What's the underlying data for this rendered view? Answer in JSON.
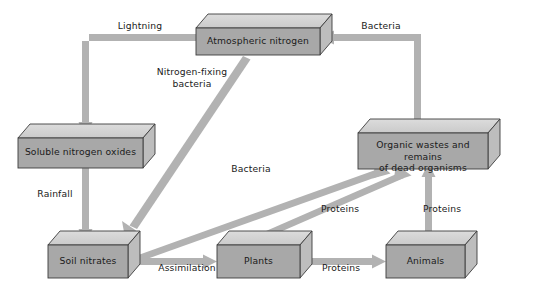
{
  "diagram": {
    "type": "flow-diagram",
    "background_color": "#ffffff",
    "palette": {
      "box_front": "#a8a8a8",
      "box_top": "#d2d2d2",
      "box_side": "#c2c2c2",
      "box_outline": "#3c3c3c",
      "arrow": "#b2b2b2",
      "text": "#1a1a1a"
    },
    "nodes": [
      {
        "id": "atmospheric-nitrogen",
        "label": "Atmospheric nitrogen"
      },
      {
        "id": "soluble-nitrogen-oxides",
        "label": "Soluble nitrogen oxides"
      },
      {
        "id": "organic-wastes",
        "label": "Organic wastes and remains\nof dead organisms"
      },
      {
        "id": "soil-nitrates",
        "label": "Soil nitrates"
      },
      {
        "id": "plants",
        "label": "Plants"
      },
      {
        "id": "animals",
        "label": "Animals"
      }
    ],
    "edges": [
      {
        "id": "lightning",
        "label": "Lightning",
        "from": "atmospheric-nitrogen",
        "to": "soluble-nitrogen-oxides"
      },
      {
        "id": "rainfall",
        "label": "Rainfall",
        "from": "soluble-nitrogen-oxides",
        "to": "soil-nitrates"
      },
      {
        "id": "nitrogen-fixing-bacteria",
        "label": "Nitrogen-fixing\nbacteria",
        "from": "atmospheric-nitrogen",
        "to": "soil-nitrates"
      },
      {
        "id": "bacteria-decay",
        "label": "Bacteria",
        "from": "soil-nitrates",
        "to": "organic-wastes"
      },
      {
        "id": "assimilation",
        "label": "Assimilation",
        "from": "soil-nitrates",
        "to": "plants"
      },
      {
        "id": "proteins-plants-animals",
        "label": "Proteins",
        "from": "plants",
        "to": "animals"
      },
      {
        "id": "proteins-plants-wastes",
        "label": "Proteins",
        "from": "plants",
        "to": "organic-wastes"
      },
      {
        "id": "proteins-animals-wastes",
        "label": "Proteins",
        "from": "animals",
        "to": "organic-wastes"
      },
      {
        "id": "bacteria-denitrification",
        "label": "Bacteria",
        "from": "organic-wastes",
        "to": "atmospheric-nitrogen"
      }
    ]
  }
}
